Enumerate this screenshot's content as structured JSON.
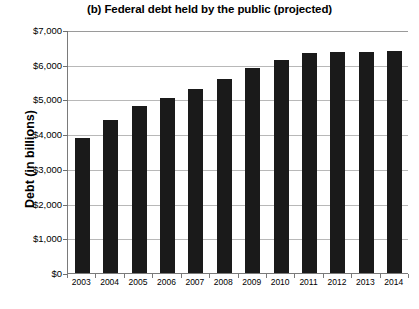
{
  "chart_data": {
    "type": "bar",
    "title": "(b) Federal debt held by the public (projected)",
    "xlabel": "",
    "ylabel": "Debt (in billions)",
    "categories": [
      "2003",
      "2004",
      "2005",
      "2006",
      "2007",
      "2008",
      "2009",
      "2010",
      "2011",
      "2012",
      "2013",
      "2014"
    ],
    "values": [
      3900,
      4400,
      4800,
      5050,
      5300,
      5600,
      5900,
      6150,
      6350,
      6380,
      6380,
      6400
    ],
    "ylim": [
      0,
      7000
    ],
    "ytick_values": [
      0,
      1000,
      2000,
      3000,
      4000,
      5000,
      6000,
      7000
    ],
    "ytick_labels": [
      "$0",
      "$1,000",
      "$2,000",
      "$3,000",
      "$4,000",
      "$5,000",
      "$6,000",
      "$7,000"
    ],
    "grid": true,
    "legend": false,
    "bar_color": "#1a1a1a",
    "gridline_color": "#b8b8b8",
    "axis_color": "#7a7a7a",
    "background_color": "#ffffff"
  }
}
